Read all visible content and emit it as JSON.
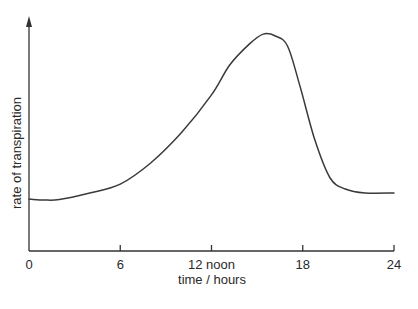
{
  "chart_data": {
    "type": "line",
    "title": "",
    "xlabel": "time / hours",
    "ylabel": "rate of transpiration",
    "xlim": [
      0,
      24
    ],
    "ylim": [
      0,
      100
    ],
    "y_units": "relative (no y tick labels shown)",
    "grid": false,
    "legend": "none",
    "x_ticks": [
      {
        "value": 0,
        "label": "0"
      },
      {
        "value": 6,
        "label": "6"
      },
      {
        "value": 12,
        "label": "12 noon"
      },
      {
        "value": 18,
        "label": "18"
      },
      {
        "value": 24,
        "label": "24"
      }
    ],
    "series": [
      {
        "name": "rate of transpiration",
        "x": [
          0,
          1,
          2,
          4,
          6,
          8,
          10,
          12,
          13.2,
          14.5,
          15.4,
          16.2,
          17.0,
          17.8,
          18.8,
          19.8,
          20.8,
          22.1,
          24
        ],
        "y": [
          22.2,
          21.8,
          22.0,
          24.8,
          28.6,
          37.6,
          50.4,
          66.7,
          79.5,
          88.5,
          92.7,
          91.9,
          87.6,
          70.9,
          47.4,
          31.2,
          26.5,
          24.8,
          24.8
        ]
      }
    ]
  }
}
